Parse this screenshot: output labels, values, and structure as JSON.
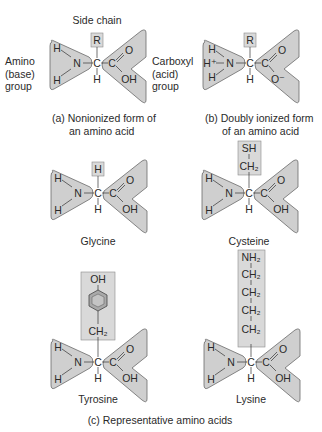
{
  "colors": {
    "shape_fill": "#cfcfcf",
    "shape_stroke": "#6a6a6a",
    "box_fill": "#d9d9d9",
    "ring_fill": "#a9a9a9",
    "text": "#2a2a2a"
  },
  "labels": {
    "side_chain": "Side chain",
    "amino_group": [
      "Amino",
      "(base)",
      "group"
    ],
    "carboxyl_group": [
      "Carboxyl",
      "(acid)",
      "group"
    ]
  },
  "panels": {
    "a": {
      "caption_line1": "(a) Nonionized form of",
      "caption_line2": "an amino acid",
      "side_group": [
        "R"
      ],
      "amine_atoms": [
        "H",
        "N",
        "H"
      ],
      "carboxyl_atoms": [
        "C",
        "O",
        "OH"
      ],
      "alpha_carbon": "C",
      "alpha_h": "H"
    },
    "b": {
      "caption_line1": "(b) Doubly ionized form",
      "caption_line2": "of an amino acid",
      "side_group": [
        "R"
      ],
      "amine_atoms": [
        "H",
        "H⁺",
        "N",
        "H"
      ],
      "carboxyl_atoms": [
        "C",
        "O",
        "O⁻"
      ],
      "alpha_carbon": "C",
      "alpha_h": "H"
    }
  },
  "amino_acids": [
    {
      "name": "Glycine",
      "side_chain": [
        "H"
      ]
    },
    {
      "name": "Cysteine",
      "side_chain": [
        "SH",
        "CH₂"
      ]
    },
    {
      "name": "Tyrosine",
      "side_chain": [
        "OH",
        "benzene-ring",
        "CH₂"
      ]
    },
    {
      "name": "Lysine",
      "side_chain": [
        "NH₂",
        "CH₂",
        "CH₂",
        "CH₂",
        "CH₂"
      ]
    }
  ],
  "section_caption": "(c) Representative amino acids"
}
